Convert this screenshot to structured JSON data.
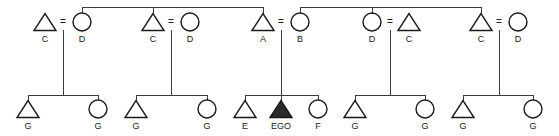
{
  "diagram": {
    "type": "pedigree",
    "colors": {
      "line": "#3b3b3b",
      "symbol_stroke": "#1a1a1a",
      "affected_fill": "#2b2b2b",
      "background": "#ffffff"
    },
    "mate_symbol": "=",
    "legend": {
      "triangle": "male",
      "circle": "female",
      "filled": "ego / proband"
    }
  },
  "generations": {
    "parent_row": {
      "couples": [
        {
          "id": "couple-1",
          "left": {
            "shape": "triangle",
            "label": "C",
            "x": 45
          },
          "right": {
            "shape": "circle",
            "label": "D",
            "x": 82
          },
          "mate_x": 63
        },
        {
          "id": "couple-2",
          "left": {
            "shape": "triangle",
            "label": "C",
            "x": 153
          },
          "right": {
            "shape": "circle",
            "label": "D",
            "x": 190
          },
          "mate_x": 171
        },
        {
          "id": "couple-3",
          "left": {
            "shape": "triangle",
            "label": "A",
            "x": 263
          },
          "right": {
            "shape": "circle",
            "label": "B",
            "x": 300
          },
          "mate_x": 281
        },
        {
          "id": "couple-4",
          "left": {
            "shape": "circle",
            "label": "D",
            "x": 372
          },
          "right": {
            "shape": "triangle",
            "label": "C",
            "x": 409
          },
          "mate_x": 390
        },
        {
          "id": "couple-5",
          "left": {
            "shape": "triangle",
            "label": "C",
            "x": 481
          },
          "right": {
            "shape": "circle",
            "label": "D",
            "x": 518
          },
          "mate_x": 499
        }
      ],
      "sibship_bars": [
        {
          "id": "sibship-bar-left",
          "x1": 82,
          "x2": 263,
          "y": 7,
          "stem_x": 153
        },
        {
          "id": "sibship-bar-right",
          "x1": 300,
          "x2": 481,
          "y": 7,
          "stem_x": 372
        }
      ]
    },
    "child_row": {
      "sibships": [
        {
          "id": "sibship-1",
          "descent_x": 63,
          "bar_x1": 28,
          "bar_x2": 98,
          "children": [
            {
              "shape": "triangle",
              "label": "G",
              "x": 28
            },
            {
              "shape": "circle",
              "label": "G",
              "x": 98
            }
          ]
        },
        {
          "id": "sibship-2",
          "descent_x": 171,
          "bar_x1": 136,
          "bar_x2": 207,
          "children": [
            {
              "shape": "triangle",
              "label": "G",
              "x": 136
            },
            {
              "shape": "circle",
              "label": "G",
              "x": 207
            }
          ]
        },
        {
          "id": "sibship-3",
          "descent_x": 281,
          "bar_x1": 245,
          "bar_x2": 318,
          "children": [
            {
              "shape": "triangle",
              "label": "E",
              "x": 245
            },
            {
              "shape": "triangle-filled",
              "label": "EGO",
              "x": 281
            },
            {
              "shape": "circle",
              "label": "F",
              "x": 318
            }
          ]
        },
        {
          "id": "sibship-4",
          "descent_x": 390,
          "bar_x1": 355,
          "bar_x2": 425,
          "children": [
            {
              "shape": "triangle",
              "label": "G",
              "x": 355
            },
            {
              "shape": "circle",
              "label": "G",
              "x": 425
            }
          ]
        },
        {
          "id": "sibship-5",
          "descent_x": 499,
          "bar_x1": 463,
          "bar_x2": 533,
          "children": [
            {
              "shape": "triangle",
              "label": "G",
              "x": 463
            },
            {
              "shape": "circle",
              "label": "G",
              "x": 533
            }
          ]
        }
      ]
    }
  },
  "geometry": {
    "top_bar_y": 7,
    "parent_symbol_cy": 22,
    "parent_label_y": 42,
    "descent_top_y": 30,
    "child_bar_y": 95,
    "child_symbol_cy": 109,
    "child_label_y": 129,
    "triangle_half_w": 11,
    "triangle_h": 17,
    "circle_r": 9
  }
}
